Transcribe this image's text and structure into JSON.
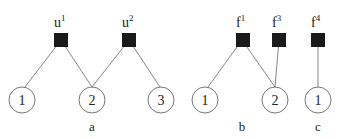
{
  "panels": [
    {
      "label": "a",
      "factors": [
        {
          "name": "u",
          "sup": "1"
        },
        {
          "name": "u",
          "sup": "2"
        }
      ],
      "variables": [
        "1",
        "2",
        "3"
      ]
    },
    {
      "label": "b",
      "factors": [
        {
          "name": "f",
          "sup": "1"
        },
        {
          "name": "f",
          "sup": "3"
        }
      ],
      "variables": [
        "1",
        "2"
      ]
    },
    {
      "label": "c",
      "factors": [
        {
          "name": "f",
          "sup": "4"
        }
      ],
      "variables": [
        "1"
      ]
    }
  ],
  "colors": {
    "factor": "#1a1a1a",
    "edge": "#888888",
    "node_stroke": "#777777"
  }
}
